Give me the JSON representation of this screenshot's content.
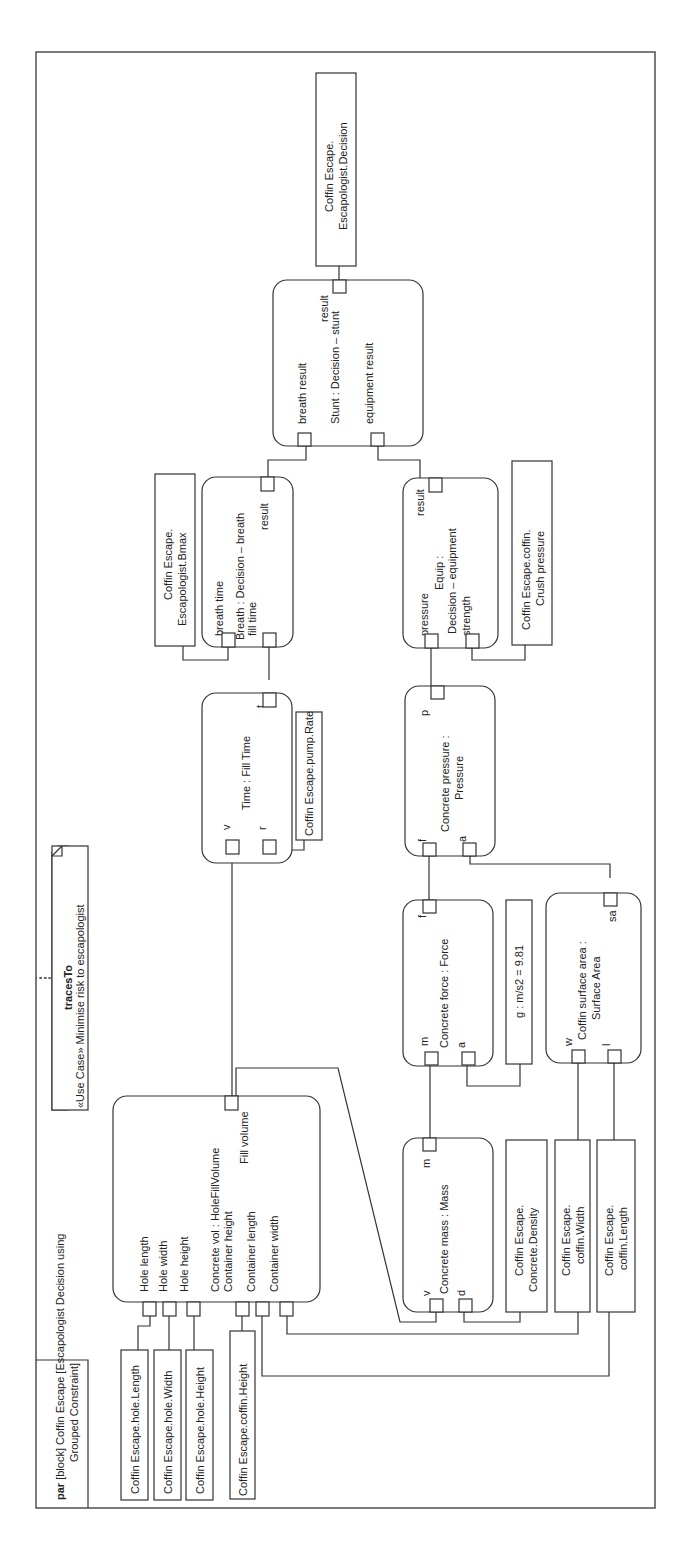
{
  "frame": {
    "title_keyword": "par",
    "title_line1": "[block] Coffin Escape [Escapologist Decision using",
    "title_line2": "Grouped Constraint]"
  },
  "note": {
    "stereotype": "tracesTo",
    "text": "«Use Case» Minimise risk to escapologist"
  },
  "value_properties": {
    "hole_length": "Coffin Escape.hole.Length",
    "hole_width": "Coffin Escape.hole.Width",
    "hole_height": "Coffin Escape.hole.Height",
    "coffin_height": "Coffin Escape.coffin.Height",
    "pump_rate": "Coffin Escape.pump.Rate",
    "bmax_line1": "Coffin Escape.",
    "bmax_line2": "Escapologist.Bmax",
    "decision_line1": "Coffin Escape.",
    "decision_line2": "Escapologist.Decision",
    "crush_line1": "Coffin Escape.coffin.",
    "crush_line2": "Crush pressure",
    "gravity": "g : m/s2 = 9.81",
    "density_line1": "Coffin Escape.",
    "density_line2": "Concrete.Density",
    "coffin_width_line1": "Coffin Escape.",
    "coffin_width_line2": "coffin.Width",
    "coffin_length_line1": "Coffin Escape.",
    "coffin_length_line2": "coffin.Length"
  },
  "constraints": {
    "concrete_vol": {
      "name": "Concrete vol : HoleFillVolume",
      "ports": {
        "hole_length": "Hole length",
        "hole_width": "Hole width",
        "hole_height": "Hole height",
        "container_height": "Container height",
        "container_length": "Container length",
        "container_width": "Container width",
        "fill_volume": "Fill volume"
      }
    },
    "time": {
      "name": "Time : Fill Time",
      "ports": {
        "v": "v",
        "r": "r",
        "t": "t"
      }
    },
    "breath": {
      "name": "Breath : Decision – breath",
      "ports": {
        "breath_time": "breath time",
        "fill_time": "fill time",
        "result": "result"
      }
    },
    "stunt": {
      "name": "Stunt : Decision – stunt",
      "ports": {
        "breath_result": "breath result",
        "equipment_result": "equipment result",
        "result": "result"
      }
    },
    "equip": {
      "name_line1": "Equip :",
      "name_line2": "Decision – equipment",
      "ports": {
        "pressure": "pressure",
        "strength": "strength",
        "result": "result"
      }
    },
    "pressure": {
      "name_line1": "Concrete pressure :",
      "name_line2": "Pressure",
      "ports": {
        "f": "f",
        "a": "a",
        "p": "p"
      }
    },
    "force": {
      "name": "Concrete force : Force",
      "ports": {
        "m": "m",
        "a": "a",
        "f": "f"
      }
    },
    "surface": {
      "name_line1": "Coffin surface area :",
      "name_line2": "Surface Area",
      "ports": {
        "w": "w",
        "l": "l",
        "sa": "sa"
      }
    },
    "mass": {
      "name": "Concrete mass : Mass",
      "ports": {
        "v": "v",
        "d": "d",
        "m": "m"
      }
    }
  }
}
